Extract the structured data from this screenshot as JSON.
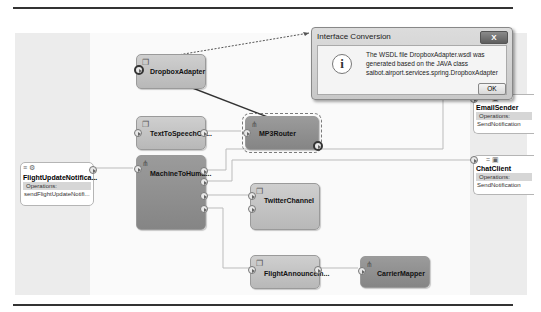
{
  "dialog": {
    "title": "Interface Conversion",
    "close_label": "X",
    "icon": "info-icon",
    "message_lines": [
      "The WSDL file DropboxAdapter.wsdl was",
      "generated based on the JAVA class",
      "saibot.airport.services.spring.DropboxAdapter"
    ],
    "ok_label": "OK"
  },
  "exposed_services": [
    {
      "name": "FlightUpdateNotifica...",
      "operations_label": "Operations:",
      "operations": [
        "sendFlightUpdateNotifi..."
      ]
    }
  ],
  "components": [
    {
      "name": "DropboxAdapter",
      "style": "light",
      "icon": "spring-bean-icon"
    },
    {
      "name": "TextToSpeechCo...",
      "style": "light",
      "icon": "spring-bean-icon"
    },
    {
      "name": "MP3Router",
      "style": "dark",
      "icon": "mediator-icon",
      "selected": true
    },
    {
      "name": "MachineToHuma...",
      "style": "dark",
      "icon": "mediator-icon"
    },
    {
      "name": "TwitterChannel",
      "style": "light",
      "icon": "spring-bean-icon"
    },
    {
      "name": "FlightAnnouncem...",
      "style": "light",
      "icon": "spring-bean-icon"
    },
    {
      "name": "CarrierMapper",
      "style": "dark",
      "icon": "mediator-icon"
    }
  ],
  "external_references": [
    {
      "name": "EmailSender",
      "operations_label": "Operations:",
      "operations": [
        "SendNotification"
      ]
    },
    {
      "name": "ChatClient",
      "operations_label": "Operations:",
      "operations": [
        "SendNotification"
      ]
    }
  ]
}
